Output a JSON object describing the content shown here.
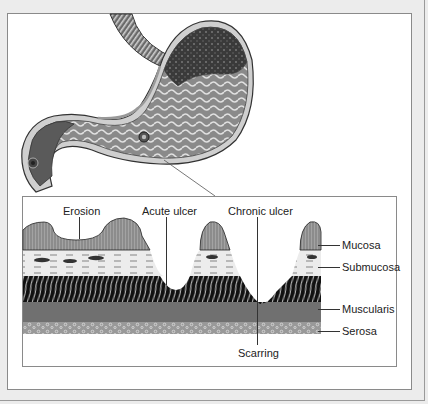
{
  "figure": {
    "stomach_illustration": {
      "parts_depicted": [
        "esophagus",
        "fundus",
        "body",
        "rugae",
        "ulcer",
        "pylorus",
        "duodenum"
      ]
    },
    "detail": {
      "top_labels": {
        "erosion": "Erosion",
        "acute_ulcer": "Acute ulcer",
        "chronic_ulcer": "Chronic ulcer"
      },
      "layer_labels": {
        "mucosa": "Mucosa",
        "submucosa": "Submucosa",
        "muscularis": "Muscularis",
        "serosa": "Serosa"
      },
      "bottom_labels": {
        "scarring": "Scarring"
      }
    }
  },
  "colors": {
    "background": "#ececec",
    "panel": "#ffffff",
    "frame_border": "#8a8a8a",
    "ink": "#222222",
    "mucosa": "#9a9a9a",
    "submucosa": "#e6e6e6",
    "muscularis_dark": "#1a1a1a",
    "muscle_band": "#6e6e6e",
    "serosa": "#8c8c8c"
  }
}
